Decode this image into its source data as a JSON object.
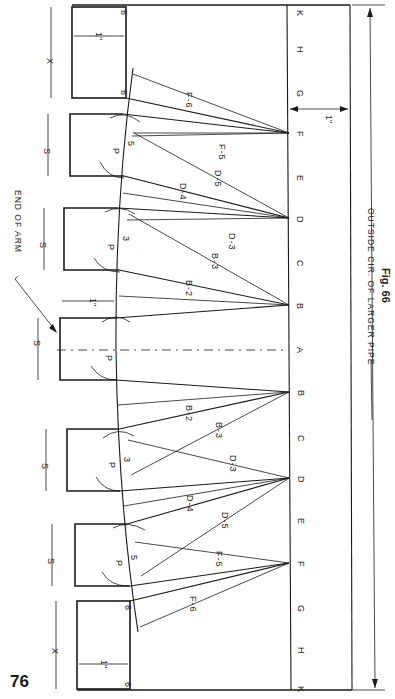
{
  "page": {
    "page_number": "76",
    "figure_label": "Fig. 66",
    "orientation": "rotated 90° clockwise"
  },
  "drawing": {
    "title_annotation": "END OF ARM",
    "outside_label": "OUTSIDE CIR. OF LARGER PIPE",
    "dimension_labels": {
      "s": "S",
      "x": "X",
      "one_inch": "1\""
    },
    "baseline_points": [
      "K",
      "H",
      "G",
      "F",
      "E",
      "D",
      "C",
      "B",
      "A",
      "B",
      "C",
      "D",
      "E",
      "F",
      "G",
      "H",
      "K"
    ],
    "line_labels": {
      "f6": "F-6",
      "f5": "F-5",
      "d5": "D-5",
      "d4": "D-4",
      "d3": "D-3",
      "b3": "B-3",
      "b2": "B-2"
    },
    "arc_labels": {
      "p": "P",
      "three": "3",
      "five": "5",
      "six": "6"
    }
  }
}
